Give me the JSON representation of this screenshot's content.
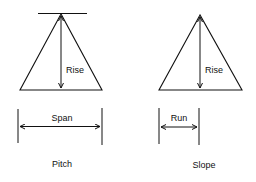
{
  "diagrams": [
    {
      "name": "pitch",
      "caption": "Pitch",
      "vertical_label": "Rise",
      "horizontal_label": "Span"
    },
    {
      "name": "slope",
      "caption": "Slope",
      "vertical_label": "Rise",
      "horizontal_label": "Run"
    }
  ],
  "colors": {
    "line": "#111111",
    "background": "#ffffff"
  }
}
